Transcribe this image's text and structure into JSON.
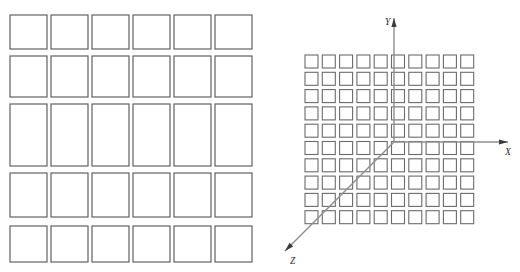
{
  "figure": {
    "title": "",
    "background_color": "#ffffff",
    "width": 520,
    "height": 272
  },
  "panels": [
    {
      "id": "left-panel",
      "name": "coarse-rectangular-grid",
      "description": "Grid of 6 columns by 5 rows of outlined rectangles with varying row heights",
      "columns": 6,
      "rows": 5,
      "stroke_color": "#5a5a5a",
      "fill_color": "#ffffff",
      "column_x": [
        10,
        51,
        92,
        133,
        174,
        215
      ],
      "column_width": 37,
      "row_y": [
        15,
        56,
        104,
        173,
        226
      ],
      "row_heights": [
        34,
        41,
        62,
        44,
        36
      ],
      "labels": []
    },
    {
      "id": "right-panel",
      "name": "fine-grid-with-axes",
      "description": "Grid of 10 columns by 10 rows of small outlined squares overlaid by a 3D coordinate axis triad",
      "columns": 10,
      "rows": 10,
      "stroke_color": "#6b6b6b",
      "fill_color": "#ffffff",
      "cell_size": 13,
      "cell_pitch": 17.3,
      "grid_origin_x": 305,
      "grid_origin_y": 55,
      "axes": {
        "origin": {
          "x": 394,
          "y": 142
        },
        "color": "#8e8e8e",
        "arrow_color": "#3b3b3b",
        "items": [
          {
            "name": "y-axis",
            "label": "Y",
            "label_x": 385,
            "label_y": 25,
            "from": {
              "x": 394,
              "y": 142
            },
            "to": {
              "x": 394,
              "y": 18
            },
            "direction": "up"
          },
          {
            "name": "x-axis",
            "label": "X",
            "label_x": 505,
            "label_y": 155,
            "from": {
              "x": 394,
              "y": 142
            },
            "to": {
              "x": 508,
              "y": 142
            },
            "direction": "right"
          },
          {
            "name": "z-axis",
            "label": "Z",
            "label_x": 290,
            "label_y": 264,
            "from": {
              "x": 394,
              "y": 142
            },
            "to": {
              "x": 285,
              "y": 251
            },
            "direction": "down-left"
          }
        ]
      }
    }
  ],
  "chart_data": {
    "type": "diagram",
    "title": "",
    "subtitle": "",
    "xlabel": "X",
    "ylabel": "Y",
    "zlabel": "Z",
    "legend": [],
    "annotations": [],
    "grid": true,
    "elements": {
      "left_grid_cells": 30,
      "right_grid_cells": 100
    }
  }
}
